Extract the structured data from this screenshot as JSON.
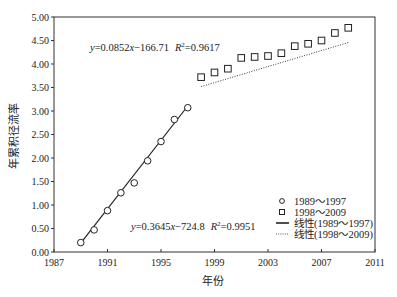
{
  "chart_data": {
    "type": "scatter",
    "title": "",
    "xlabel": "年份",
    "ylabel": "年累积径流率",
    "xlim": [
      1987,
      2011
    ],
    "ylim": [
      0,
      5
    ],
    "xticks": [
      1987,
      1991,
      1995,
      1999,
      2003,
      2007,
      2011
    ],
    "xtick_labels": [
      "1987",
      "1991",
      "1995",
      "1999",
      "2003",
      "2007",
      "2011"
    ],
    "yticks": [
      0,
      0.5,
      1,
      1.5,
      2,
      2.5,
      3,
      3.5,
      4,
      4.5,
      5
    ],
    "ytick_labels": [
      "0.00",
      "0.50",
      "1.00",
      "1.50",
      "2.00",
      "2.50",
      "3.00",
      "3.50",
      "4.00",
      "4.50",
      "5.00"
    ],
    "grid": false,
    "legend_position": "lower right",
    "series": [
      {
        "name": "1989～1997",
        "marker": "circle",
        "x": [
          1989,
          1990,
          1991,
          1992,
          1993,
          1994,
          1995,
          1996,
          1997
        ],
        "values": [
          0.2,
          0.47,
          0.88,
          1.26,
          1.47,
          1.94,
          2.35,
          2.82,
          3.07
        ]
      },
      {
        "name": "1998～2009",
        "marker": "square",
        "x": [
          1998,
          1999,
          2000,
          2001,
          2002,
          2003,
          2004,
          2005,
          2006,
          2007,
          2008,
          2009
        ],
        "values": [
          3.72,
          3.82,
          3.9,
          4.13,
          4.15,
          4.17,
          4.23,
          4.38,
          4.43,
          4.5,
          4.66,
          4.77
        ]
      }
    ],
    "trendlines": [
      {
        "name": "线性(1989～1997)",
        "style": "solid",
        "slope": 0.3645,
        "intercept": -724.8,
        "x_range": [
          1989,
          1997
        ],
        "equation": "y=0.3645x−724.8",
        "r2": "R²=0.9951"
      },
      {
        "name": "线性(1998～2009)",
        "style": "dotted",
        "slope": 0.0852,
        "intercept": -166.71,
        "x_range": [
          1998,
          2009
        ],
        "equation": "y=0.0852x−166.71",
        "r2": "R²=0.9617"
      }
    ],
    "annotations": [
      {
        "text": "y=0.0852x−166.71  R²=0.9617",
        "x": 1992.5,
        "y": 4.55
      },
      {
        "text": "y=0.3645x−724.8  R²=0.9951",
        "x": 1996.2,
        "y": 0.55
      }
    ]
  },
  "legend": {
    "items": [
      {
        "label": "1989～1997",
        "symbol": "circle"
      },
      {
        "label": "1998～2009",
        "symbol": "square"
      },
      {
        "label": "线性(1989～1997)",
        "symbol": "solid-line"
      },
      {
        "label": "线性(1998～2009)",
        "symbol": "dotted-line"
      }
    ]
  },
  "axes": {
    "x_title": "年份",
    "y_title": "年累积径流率"
  },
  "equations": {
    "upper": {
      "y": "y",
      "body": "=0.0852",
      "x": "x",
      "tail": "−166.71",
      "r": "R",
      "sup": "2",
      "rval": "=0.9617"
    },
    "lower": {
      "y": "y",
      "body": "=0.3645",
      "x": "x",
      "tail": "−724.8",
      "r": "R",
      "sup": "2",
      "rval": "=0.9951"
    }
  },
  "colors": {
    "axis": "#333333",
    "marker": "#222222",
    "line": "#222222",
    "text": "#222222",
    "background": "#ffffff"
  }
}
